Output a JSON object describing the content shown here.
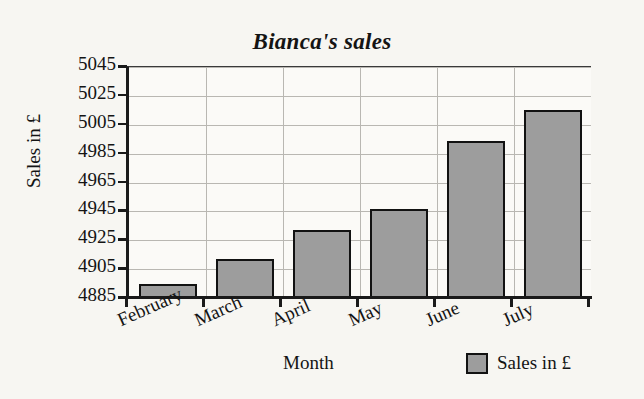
{
  "chart_data": {
    "type": "bar",
    "title": "Bianca's sales",
    "xlabel": "Month",
    "ylabel": "Sales in £",
    "categories": [
      "February",
      "March",
      "April",
      "May",
      "June",
      "July"
    ],
    "values": [
      4895,
      4912,
      4932,
      4947,
      4994,
      5015
    ],
    "series": [
      {
        "name": "Sales in £",
        "values": [
          4895,
          4912,
          4932,
          4947,
          4994,
          5015
        ]
      }
    ],
    "ylim": [
      4885,
      5045
    ],
    "ytick_labels": [
      "4885",
      "4905",
      "4925",
      "4945",
      "4965",
      "4985",
      "5005",
      "5025",
      "5045"
    ],
    "ytick_values": [
      4885,
      4905,
      4925,
      4945,
      4965,
      4985,
      5005,
      5025,
      5045
    ],
    "ytick_step": 20,
    "grid": true,
    "legend_position": "bottom-right",
    "legend_entries": [
      "Sales in £"
    ],
    "bar_color": "#9d9d9d",
    "bar_edge_color": "#121212",
    "grid_color": "#b9b7b2",
    "background_color": "#f7f6f2",
    "plot_background_color": "#fbfaf7",
    "axis_color": "#1a1a1a",
    "text_color": "#141414"
  }
}
